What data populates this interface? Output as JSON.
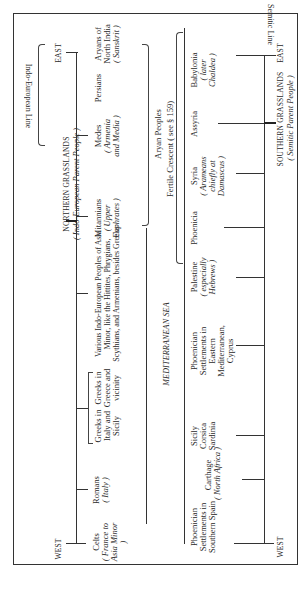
{
  "northern": {
    "title": "NORTHERN GRASSLANDS",
    "subtitle": "( Indo-European Parent People )",
    "west_label": "WEST",
    "east_label": "EAST",
    "peoples": [
      {
        "name": "Celts",
        "note": "( France to Asia Minor )"
      },
      {
        "name": "Romans",
        "note": "( Italy )"
      },
      {
        "name": "Greeks in Italy and Sicily",
        "note": ""
      },
      {
        "name": "Greeks in Greece and vicinity",
        "note": ""
      },
      {
        "name": "Various Indo-European Peoples of Asia Minor, like the Hittites, Phrygians, Scythians, and Armenians, besides Greeks",
        "note": ""
      },
      {
        "name": "Mitannians",
        "note": "( Upper Euphrates )"
      },
      {
        "name": "Medes",
        "note": "( Armenia and Media )"
      },
      {
        "name": "Persians",
        "note": ""
      },
      {
        "name": "Aryans of North India",
        "note": "( Sanskrit )"
      }
    ],
    "line_label": "Indo-European Line",
    "group_label": "Aryan Peoples"
  },
  "middle": {
    "sea_label": "MEDITERRANEAN SEA",
    "crescent_label": "Fertile Crescent ( see § 159)"
  },
  "southern": {
    "title": "SOUTHERN GRASSLANDS",
    "subtitle": "( Semitic Parent People )",
    "west_label": "WEST",
    "east_label": "EAST",
    "peoples": [
      {
        "name": "Phoenician Settlements in Southern Spain",
        "note": ""
      },
      {
        "name": "Carthage",
        "note": "( North Africa )"
      },
      {
        "name": "Sicily Corsica Sardinia",
        "note": ""
      },
      {
        "name": "Phoenician Settlements in Eastern Mediterranean, Cyprus",
        "note": ""
      },
      {
        "name": "Palestine",
        "note": "( especially Hebrews )"
      },
      {
        "name": "Phoenicia",
        "note": ""
      },
      {
        "name": "Syria",
        "note": "( Arameans chiefly at Damascus )"
      },
      {
        "name": "Assyria",
        "note": ""
      },
      {
        "name": "Babylonia",
        "note": "( later Chaldea )"
      }
    ],
    "line_label": "Semitic Line"
  }
}
